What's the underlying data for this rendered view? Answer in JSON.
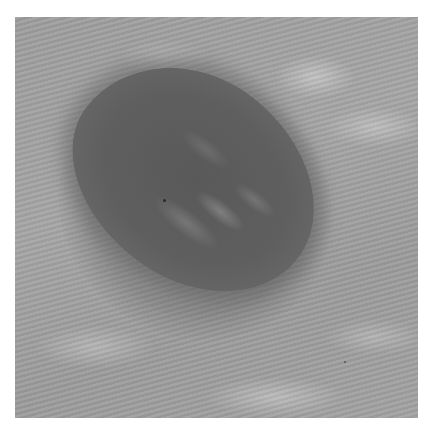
{
  "image": {
    "subject": "grayscale close-up photograph of a pigmented skin lesion",
    "colors": {
      "background": "#ffffff",
      "skin": "#a0a0a0",
      "lesion": "#5c5c5c"
    }
  }
}
